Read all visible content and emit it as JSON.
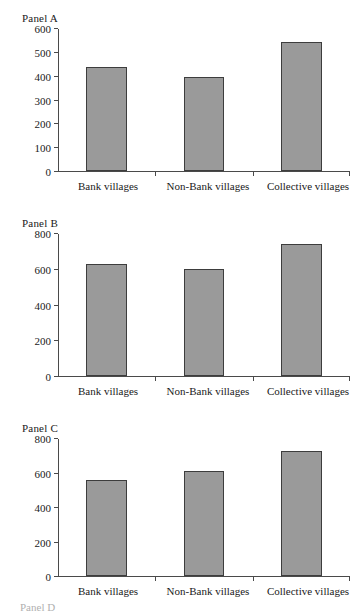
{
  "figure": {
    "background": "#ffffff",
    "bar_fill": "#9a9a9a",
    "bar_border": "#3d3d3d",
    "axis_color": "#4a4a4a",
    "clipped_label": "Panel D"
  },
  "chart_data": [
    {
      "type": "bar",
      "title": "Panel A",
      "categories": [
        "Bank villages",
        "Non-Bank villages",
        "Collective villages"
      ],
      "values": [
        440,
        400,
        545
      ],
      "xlabel": "",
      "ylabel": "",
      "ylim": [
        0,
        600
      ],
      "yticks": [
        0,
        100,
        200,
        300,
        400,
        500,
        600
      ],
      "ytick_labels": [
        "0",
        "100",
        "200",
        "300",
        "400",
        "500",
        "600"
      ],
      "grid": false,
      "legend": "none"
    },
    {
      "type": "bar",
      "title": "Panel B",
      "categories": [
        "Bank villages",
        "Non-Bank villages",
        "Collective villages"
      ],
      "values": [
        630,
        607,
        745
      ],
      "xlabel": "",
      "ylabel": "",
      "ylim": [
        0,
        800
      ],
      "yticks": [
        0,
        200,
        400,
        600,
        800
      ],
      "ytick_labels": [
        "0",
        "200",
        "400",
        "600",
        "800"
      ],
      "grid": false,
      "legend": "none"
    },
    {
      "type": "bar",
      "title": "Panel C",
      "categories": [
        "Bank villages",
        "Non-Bank villages",
        "Collective villages"
      ],
      "values": [
        565,
        612,
        730
      ],
      "xlabel": "",
      "ylabel": "",
      "ylim": [
        0,
        800
      ],
      "yticks": [
        0,
        200,
        400,
        600,
        800
      ],
      "ytick_labels": [
        "0",
        "200",
        "400",
        "600",
        "800"
      ],
      "grid": false,
      "legend": "none"
    }
  ]
}
